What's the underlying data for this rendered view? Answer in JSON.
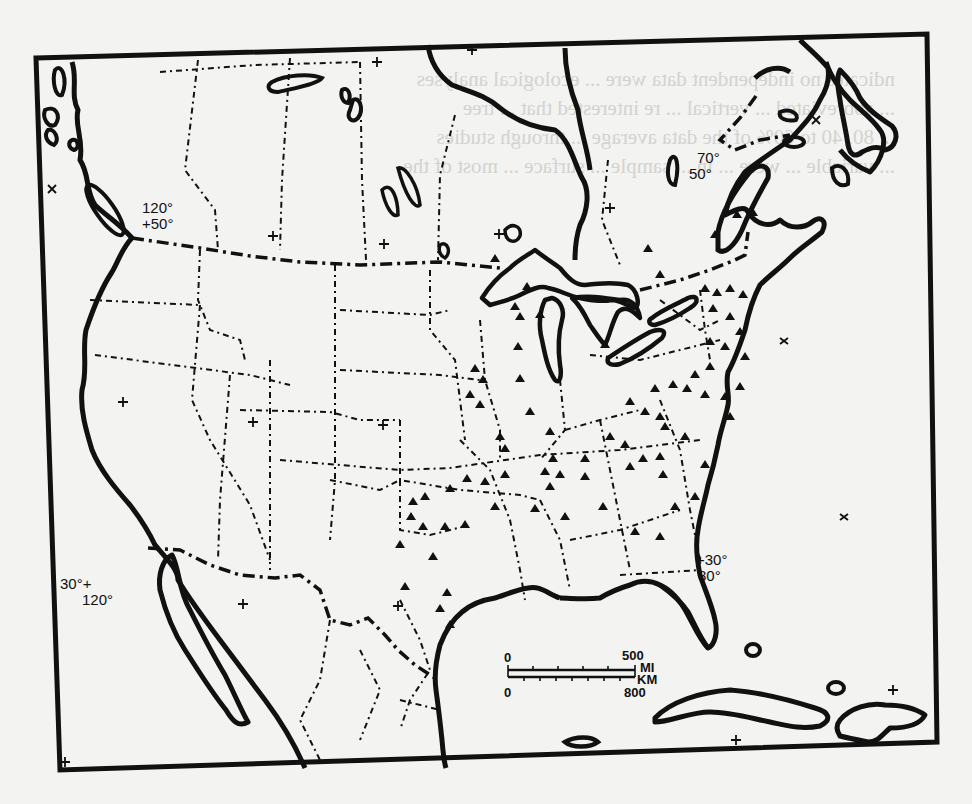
{
  "figure": {
    "bleed_through_text": [
      "ndicates no independent data were ... ecological analyses",
      "... abbreviated ... vertical ... re interested that ... tree",
      "... 80, 40 to 60% of the data average ... through studies",
      "... variable ... were ... in ... sample ... surface ... most of the",
      "... "
    ]
  },
  "coordinate_labels": [
    {
      "id": "nw",
      "line1": "120°",
      "line2": "+50°"
    },
    {
      "id": "ne",
      "line1": "70°",
      "line2": "50°"
    },
    {
      "id": "sw",
      "line1": "30°+",
      "line2": "120°"
    },
    {
      "id": "se",
      "line1": "+30°",
      "line2": "80°"
    }
  ],
  "scale_bar": {
    "top_start": "0",
    "top_end": "500",
    "top_unit": "MI",
    "bottom_unit": "KM",
    "bottom_start": "0",
    "bottom_end": "800"
  },
  "legend": {
    "site_marker": "triangle",
    "graticule_marker": "cross"
  },
  "colors": {
    "ink": "#111111",
    "paper": "#f3f3f1",
    "bleed": "#c9c9c6"
  }
}
